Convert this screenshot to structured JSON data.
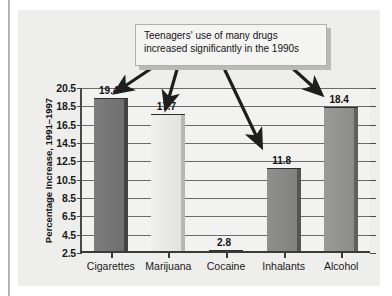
{
  "chart_data": {
    "type": "bar",
    "title": "",
    "annotation": "Teenagers' use of many drugs increased significantly in the 1990s",
    "categories": [
      "Cigarettes",
      "Marijuana",
      "Cocaine",
      "Inhalants",
      "Alcohol"
    ],
    "values": [
      19.4,
      17.7,
      2.8,
      11.8,
      18.4
    ],
    "value_labels": [
      "19.4",
      "17.7",
      "2.8",
      "11.8",
      "18.4"
    ],
    "xlabel": "",
    "ylabel": "Percentage Increase, 1991–1997",
    "ylim": [
      2.5,
      20.5
    ],
    "ytick_step": 2.0,
    "yticks": [
      "20.5",
      "18.5",
      "16.5",
      "14.5",
      "12.5",
      "10.5",
      "8.5",
      "6.5",
      "4.5",
      "2.5"
    ],
    "grid": true,
    "legend": "none",
    "bar_colors": [
      "#7d7d7d",
      "#f0f0ee",
      "#b5b5b3",
      "#8f8f8d",
      "#9a9a98"
    ]
  },
  "annotation_box": {
    "text": "Teenagers' use of many drugs increased significantly in the 1990s",
    "arrow_count": 4,
    "arrow_targets": [
      "Cigarettes",
      "Marijuana",
      "Inhalants",
      "Alcohol"
    ]
  },
  "axis": {
    "y_title": "Percentage Increase, 1991–1997"
  }
}
